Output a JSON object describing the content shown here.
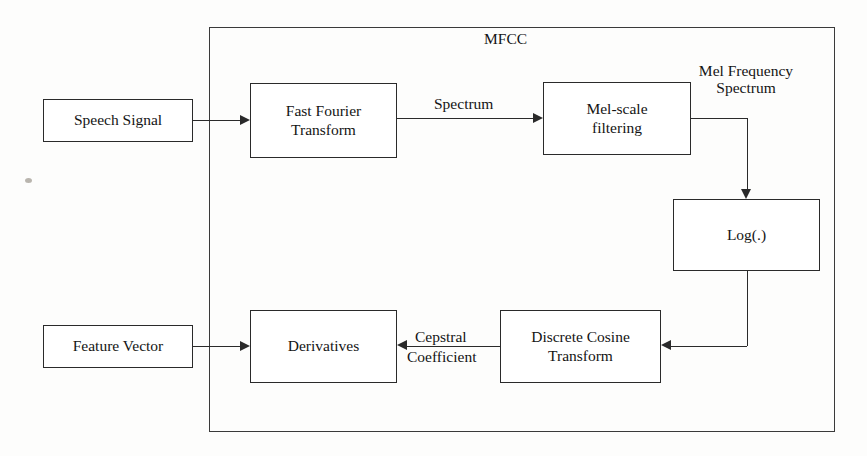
{
  "diagram": {
    "group": {
      "label": "MFCC"
    },
    "nodes": [
      {
        "id": "speech-signal",
        "label": "Speech Signal"
      },
      {
        "id": "fft",
        "label": "Fast Fourier\nTransform",
        "line1": "Fast Fourier",
        "line2": "Transform"
      },
      {
        "id": "mel-filtering",
        "label": "Mel-scale\nfiltering",
        "line1": "Mel-scale",
        "line2": "filtering"
      },
      {
        "id": "log",
        "label": "Log(.)"
      },
      {
        "id": "dct",
        "label": "Discrete Cosine\nTransform",
        "line1": "Discrete Cosine",
        "line2": "Transform"
      },
      {
        "id": "derivatives",
        "label": "Derivatives"
      },
      {
        "id": "feature-vector",
        "label": "Feature Vector"
      }
    ],
    "edge_labels": {
      "spectrum": "Spectrum",
      "mel_frequency_line1": "Mel Frequency",
      "mel_frequency_line2": "Spectrum",
      "cepstral_line1": "Cepstral",
      "cepstral_line2": "Coefficient"
    },
    "colors": {
      "stroke": "#2a2a2a",
      "text": "#141414",
      "background": "#fdfdfc",
      "node_fill": "#ffffff"
    }
  }
}
